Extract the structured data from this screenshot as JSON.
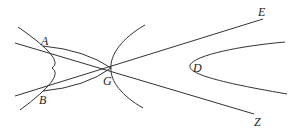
{
  "diagram": {
    "labels": {
      "A": "A",
      "B": "B",
      "G": "G",
      "D": "D",
      "E": "E",
      "Z": "Z"
    },
    "colors": {
      "stroke": "#333333",
      "text": "#222222",
      "background": "#ffffff"
    }
  }
}
